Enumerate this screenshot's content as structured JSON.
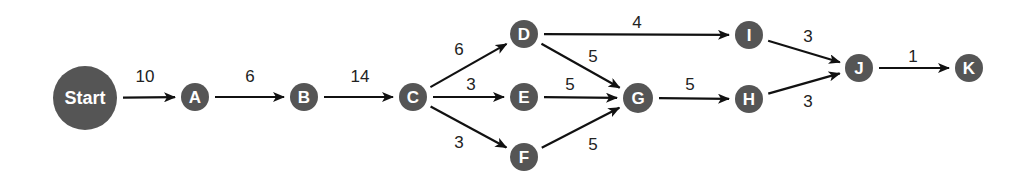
{
  "diagram": {
    "type": "network-diagram",
    "node_color": "#555555",
    "edge_color": "#111111",
    "nodes": [
      {
        "id": "Start",
        "label": "Start",
        "x": 85,
        "y": 98,
        "r": 32
      },
      {
        "id": "A",
        "label": "A",
        "x": 195,
        "y": 97,
        "r": 14
      },
      {
        "id": "B",
        "label": "B",
        "x": 304,
        "y": 97,
        "r": 14
      },
      {
        "id": "C",
        "label": "C",
        "x": 413,
        "y": 97,
        "r": 14
      },
      {
        "id": "D",
        "label": "D",
        "x": 524,
        "y": 34,
        "r": 14
      },
      {
        "id": "E",
        "label": "E",
        "x": 524,
        "y": 97,
        "r": 14
      },
      {
        "id": "F",
        "label": "F",
        "x": 524,
        "y": 157,
        "r": 14
      },
      {
        "id": "G",
        "label": "G",
        "x": 638,
        "y": 98,
        "r": 15
      },
      {
        "id": "I",
        "label": "I",
        "x": 749,
        "y": 35,
        "r": 14
      },
      {
        "id": "H",
        "label": "H",
        "x": 749,
        "y": 99,
        "r": 14
      },
      {
        "id": "J",
        "label": "J",
        "x": 859,
        "y": 68,
        "r": 14
      },
      {
        "id": "K",
        "label": "K",
        "x": 969,
        "y": 68,
        "r": 14
      }
    ],
    "edges": [
      {
        "from": "Start",
        "to": "A",
        "weight": "10",
        "lx": 145,
        "ly": 82
      },
      {
        "from": "A",
        "to": "B",
        "weight": "6",
        "lx": 250,
        "ly": 82
      },
      {
        "from": "B",
        "to": "C",
        "weight": "14",
        "lx": 360,
        "ly": 82
      },
      {
        "from": "C",
        "to": "D",
        "weight": "6",
        "lx": 459,
        "ly": 55
      },
      {
        "from": "C",
        "to": "E",
        "weight": "3",
        "lx": 471,
        "ly": 90
      },
      {
        "from": "C",
        "to": "F",
        "weight": "3",
        "lx": 459,
        "ly": 148
      },
      {
        "from": "D",
        "to": "I",
        "weight": "4",
        "lx": 637,
        "ly": 28
      },
      {
        "from": "D",
        "to": "G",
        "weight": "5",
        "lx": 593,
        "ly": 62
      },
      {
        "from": "E",
        "to": "G",
        "weight": "5",
        "lx": 570,
        "ly": 90
      },
      {
        "from": "F",
        "to": "G",
        "weight": "5",
        "lx": 593,
        "ly": 150
      },
      {
        "from": "G",
        "to": "H",
        "weight": "5",
        "lx": 690,
        "ly": 90
      },
      {
        "from": "I",
        "to": "J",
        "weight": "3",
        "lx": 808,
        "ly": 42
      },
      {
        "from": "H",
        "to": "J",
        "weight": "3",
        "lx": 808,
        "ly": 107
      },
      {
        "from": "J",
        "to": "K",
        "weight": "1",
        "lx": 913,
        "ly": 62
      }
    ]
  }
}
